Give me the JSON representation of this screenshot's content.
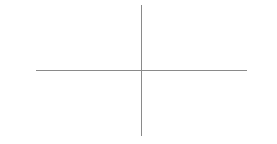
{
  "diagram": {
    "type": "cartesian-axes",
    "horizontal_axis": {
      "x_start": 36,
      "x_end": 247,
      "y": 70,
      "color": "#8a8a8a"
    },
    "vertical_axis": {
      "x": 141,
      "y_start": 5,
      "y_end": 136,
      "color": "#8a8a8a"
    },
    "background": "#ffffff"
  }
}
